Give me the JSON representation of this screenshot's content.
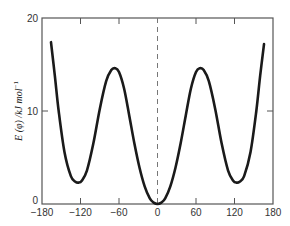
{
  "chart_data": {
    "type": "line",
    "title": "",
    "xlabel": "",
    "ylabel": "E (φ) /kJ mol⁻¹",
    "ylabel_parts": {
      "main": "E (φ) /kJ mol",
      "sup": "−1"
    },
    "xlim": [
      -180,
      180
    ],
    "ylim": [
      0,
      20
    ],
    "x_ticks": [
      -180,
      -120,
      -60,
      0,
      60,
      120,
      180
    ],
    "x_tick_labels": [
      "−180",
      "−120",
      "−60",
      "0",
      "60",
      "120",
      "180"
    ],
    "y_ticks": [
      0,
      10,
      20
    ],
    "y_tick_labels": [
      "0",
      "10",
      "20"
    ],
    "grid": false,
    "legend": null,
    "reference_line": {
      "type": "vertical",
      "x": 0,
      "style": "dashed"
    },
    "series": [
      {
        "name": "E(φ)",
        "x": [
          -166,
          -160,
          -154,
          -145,
          -135,
          -128,
          -123,
          -118,
          -110,
          -100,
          -90,
          -80,
          -72,
          -66,
          -60,
          -52,
          -44,
          -36,
          -28,
          -20,
          -12,
          -6,
          0,
          6,
          12,
          20,
          28,
          36,
          44,
          52,
          60,
          66,
          72,
          80,
          90,
          100,
          110,
          118,
          123,
          128,
          135,
          145,
          154,
          160,
          166
        ],
        "values": [
          17.4,
          13.8,
          10.0,
          5.6,
          3.0,
          2.4,
          2.3,
          2.5,
          3.6,
          6.5,
          10.2,
          13.2,
          14.4,
          14.6,
          14.2,
          12.4,
          9.5,
          6.5,
          3.9,
          1.9,
          0.6,
          0.15,
          0.0,
          0.15,
          0.6,
          1.9,
          3.9,
          6.5,
          9.5,
          12.4,
          14.2,
          14.6,
          14.4,
          13.2,
          10.2,
          6.5,
          3.6,
          2.5,
          2.3,
          2.4,
          3.0,
          5.6,
          10.0,
          13.8,
          17.2
        ]
      }
    ]
  },
  "caption_fragment": "…"
}
